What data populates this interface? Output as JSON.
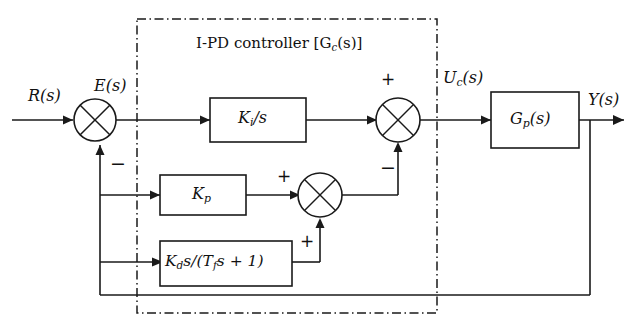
{
  "figure": {
    "kind": "control-system-block-diagram",
    "title": "I-PD controller [Gc(s)]",
    "background_color": "#ffffff",
    "line_color": "#1a1a1a"
  },
  "group": {
    "label": "I-PD controller [G",
    "label_sub": "c",
    "label_tail": "(s)]",
    "border_style": "dash-dot"
  },
  "signals": {
    "reference": "R(s)",
    "error": "E(s)",
    "control": "U",
    "control_sub": "c",
    "control_tail": "(s)",
    "output": "Y(s)"
  },
  "blocks": [
    {
      "name": "integral-block",
      "label_main": "K",
      "label_sub": "i",
      "label_tail": "/s",
      "text": "Ki/s"
    },
    {
      "name": "proportional-block",
      "label_main": "K",
      "label_sub": "p",
      "label_tail": "",
      "text": "Kp"
    },
    {
      "name": "derivative-block",
      "label_main": "K",
      "label_sub": "d",
      "label_tail": "s/(T",
      "label_sub2": "f",
      "label_tail2": "s + 1)",
      "text": "Kds/(Tfs + 1)"
    },
    {
      "name": "plant-block",
      "label_main": "G",
      "label_sub": "p",
      "label_tail": "(s)",
      "text": "Gp(s)"
    }
  ],
  "summing_junctions": [
    {
      "name": "error-summing-junction",
      "signs": [
        "+",
        "-"
      ],
      "visible_sign": "−"
    },
    {
      "name": "control-summing-junction",
      "top_sign": "+",
      "bottom_sign": "−"
    },
    {
      "name": "pd-summing-junction",
      "left_sign": "+",
      "bottom_sign": "+"
    }
  ],
  "signs": {
    "error_minus": "−",
    "control_plus": "+",
    "control_minus": "−",
    "pd_plus_left": "+",
    "pd_plus_bottom": "+"
  }
}
